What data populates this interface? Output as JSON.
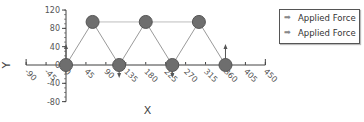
{
  "chart_data": {
    "type": "scatter",
    "subtype": "truss-diagram",
    "xlabel": "X",
    "ylabel": "Y",
    "xlim": [
      -90,
      450
    ],
    "ylim": [
      -80,
      120
    ],
    "x_ticks": [
      -90,
      -45,
      0,
      45,
      90,
      135,
      180,
      225,
      270,
      315,
      360,
      405,
      450
    ],
    "y_ticks": [
      -80,
      -40,
      0,
      40,
      80,
      120
    ],
    "grid": false,
    "legend_position": "top-right",
    "nodes": [
      {
        "x": 0,
        "y": 0
      },
      {
        "x": 60,
        "y": 94
      },
      {
        "x": 120,
        "y": 0
      },
      {
        "x": 180,
        "y": 94
      },
      {
        "x": 240,
        "y": 0
      },
      {
        "x": 300,
        "y": 94
      },
      {
        "x": 360,
        "y": 0
      }
    ],
    "members": [
      [
        0,
        1
      ],
      [
        1,
        2
      ],
      [
        2,
        3
      ],
      [
        3,
        4
      ],
      [
        4,
        5
      ],
      [
        5,
        6
      ],
      [
        1,
        3
      ],
      [
        3,
        5
      ],
      [
        0,
        2
      ],
      [
        2,
        4
      ],
      [
        4,
        6
      ]
    ],
    "forces": [
      {
        "x": 0,
        "y": 0,
        "direction": "up",
        "magnitude_hint": 40
      },
      {
        "x": 120,
        "y": 0,
        "direction": "down",
        "magnitude_hint": -20
      },
      {
        "x": 240,
        "y": 0,
        "direction": "down",
        "magnitude_hint": -20
      },
      {
        "x": 360,
        "y": 0,
        "direction": "up",
        "magnitude_hint": 40
      }
    ],
    "legend": [
      "Applied Force",
      "Applied Force"
    ]
  },
  "legend": {
    "items": [
      {
        "label": "Applied Force",
        "icon": "arrow-right-icon"
      },
      {
        "label": "Applied Force",
        "icon": "arrow-right-icon"
      }
    ]
  },
  "axes": {
    "xlabel": "X",
    "ylabel": "Y"
  },
  "colors": {
    "node_fill": "#6e6e6e",
    "node_stroke": "#555555",
    "member": "#9a9a9a",
    "top_chord": "#bdbdbd",
    "axis": "#444444",
    "force": "#555555"
  }
}
